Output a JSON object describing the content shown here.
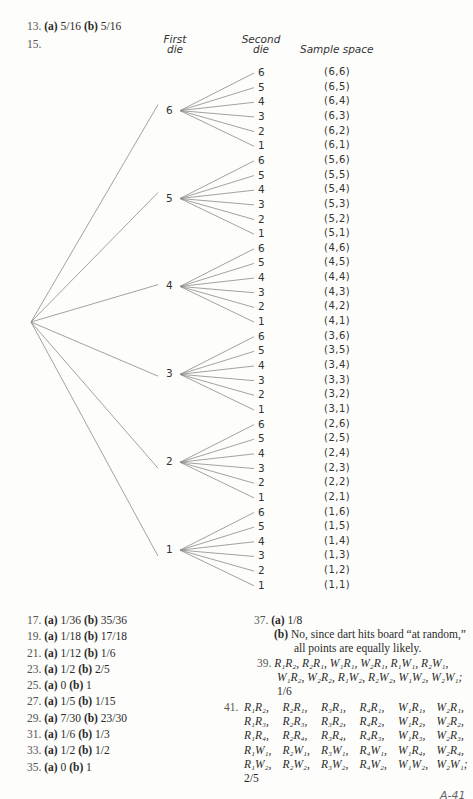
{
  "problem13": {
    "num": "13.",
    "a_label": "(a)",
    "a": "5/16",
    "b_label": "(b)",
    "b": "5/16"
  },
  "problem15": {
    "num": "15.",
    "headers": {
      "first_die_1": "First",
      "first_die_2": "die",
      "second_die_1": "Second",
      "second_die_2": "die",
      "sample_space": "Sample space"
    },
    "first_die": [
      "6",
      "5",
      "4",
      "3",
      "2",
      "1"
    ],
    "second_die": [
      "6",
      "5",
      "4",
      "3",
      "2",
      "1"
    ],
    "sample_space": [
      [
        "(6,6)",
        "(6,5)",
        "(6,4)",
        "(6,3)",
        "(6,2)",
        "(6,1)"
      ],
      [
        "(5,6)",
        "(5,5)",
        "(5,4)",
        "(5,3)",
        "(5,2)",
        "(5,1)"
      ],
      [
        "(4,6)",
        "(4,5)",
        "(4,4)",
        "(4,3)",
        "(4,2)",
        "(4,1)"
      ],
      [
        "(3,6)",
        "(3,5)",
        "(3,4)",
        "(3,3)",
        "(3,2)",
        "(3,1)"
      ],
      [
        "(2,6)",
        "(2,5)",
        "(2,4)",
        "(2,3)",
        "(2,2)",
        "(2,1)"
      ],
      [
        "(1,6)",
        "(1,5)",
        "(1,4)",
        "(1,3)",
        "(1,2)",
        "(1,1)"
      ]
    ]
  },
  "answers_left": [
    {
      "num": "17.",
      "a": "1/36",
      "b": "35/36"
    },
    {
      "num": "19.",
      "a": "1/18",
      "b": "17/18"
    },
    {
      "num": "21.",
      "a": "1/12",
      "b": "1/6"
    },
    {
      "num": "23.",
      "a": "1/2",
      "b": "2/5"
    },
    {
      "num": "25.",
      "a": "0",
      "b": "1"
    },
    {
      "num": "27.",
      "a": "1/5",
      "b": "1/15"
    },
    {
      "num": "29.",
      "a": "7/30",
      "b": "23/30"
    },
    {
      "num": "31.",
      "a": "1/6",
      "b": "1/3"
    },
    {
      "num": "33.",
      "a": "1/2",
      "b": "1/2"
    },
    {
      "num": "35.",
      "a": "0",
      "b": "1"
    }
  ],
  "labels": {
    "a": "(a)",
    "b": "(b)"
  },
  "problem37": {
    "num": "37.",
    "a": "1/8",
    "b_line1": "No, since dart hits board “at random,”",
    "b_line2": "all points are equally likely."
  },
  "problem39": {
    "num": "39.",
    "line1": "R₁R₂, R₂R₁, W₁R₁, W₂R₁, R₁W₁, R₂W₁,",
    "line2": "W₁R₂, W₂R₂, R₁W₂, R₂W₂, W₁W₂, W₂W₁;",
    "answer": "1/6"
  },
  "problem41": {
    "num": "41.",
    "rows": [
      [
        "R₁R₂,",
        "R₂R₁,",
        "R₃R₁,",
        "R₄R₁,",
        "W₁R₁,",
        "W₂R₁,"
      ],
      [
        "R₁R₃,",
        "R₂R₃,",
        "R₃R₂,",
        "R₄R₂,",
        "W₁R₂,",
        "W₂R₂,"
      ],
      [
        "R₁R₄,",
        "R₂R₄,",
        "R₃R₄,",
        "R₄R₃,",
        "W₁R₃,",
        "W₂R₃,"
      ],
      [
        "R₁W₁,",
        "R₂W₁,",
        "R₃W₁,",
        "R₄W₁,",
        "W₁R₄,",
        "W₂R₄,"
      ],
      [
        "R₁W₂,",
        "R₂W₂,",
        "R₃W₂,",
        "R₄W₂,",
        "W₁W₂,",
        "W₂W₁;"
      ]
    ],
    "answer": "2/5"
  },
  "page_number": "A-41"
}
